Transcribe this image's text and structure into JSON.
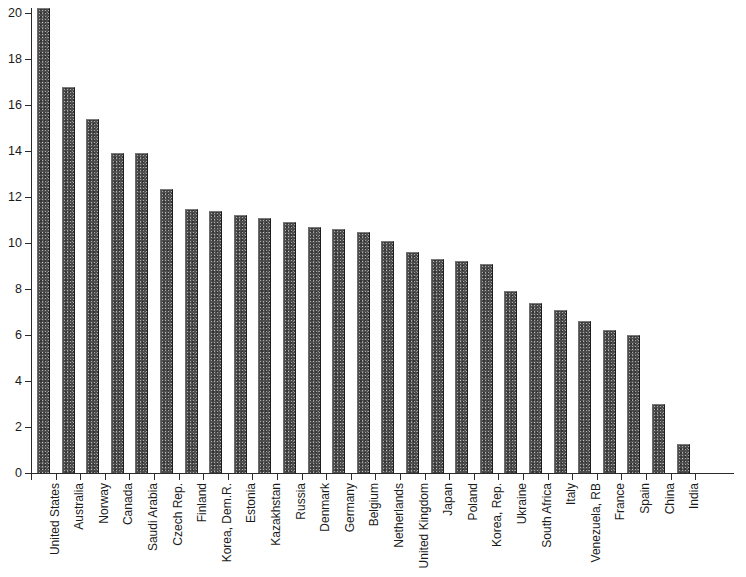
{
  "chart_data": {
    "type": "bar",
    "title": "",
    "subtitle": "",
    "xlabel": "",
    "ylabel": "",
    "ylim": [
      0,
      20
    ],
    "y_ticks": [
      0,
      2,
      4,
      6,
      8,
      10,
      12,
      14,
      16,
      18,
      20
    ],
    "grid": false,
    "legend": null,
    "bar_color": "#4d4d4d",
    "axis_color": "#2b2b2b",
    "categories": [
      "United States",
      "Australia",
      "Norway",
      "Canada",
      "Saudi Arabia",
      "Czech Rep.",
      "Finland",
      "Korea, Dem.R.",
      "Estonia",
      "Kazakhstan",
      "Russia",
      "Denmark",
      "Germany",
      "Belgium",
      "Netherlands",
      "United Kingdom",
      "Japan",
      "Poland",
      "Korea, Rep.",
      "Ukraine",
      "South Africa",
      "Italy",
      "Venezuela, RB",
      "France",
      "Spain",
      "China",
      "India"
    ],
    "values": [
      20.2,
      16.8,
      15.4,
      13.9,
      13.9,
      12.35,
      11.5,
      11.4,
      11.2,
      11.1,
      10.9,
      10.7,
      10.6,
      10.5,
      10.1,
      9.6,
      9.3,
      9.2,
      9.1,
      7.9,
      7.4,
      7.1,
      6.6,
      6.2,
      6.0,
      3.0,
      1.25
    ]
  }
}
